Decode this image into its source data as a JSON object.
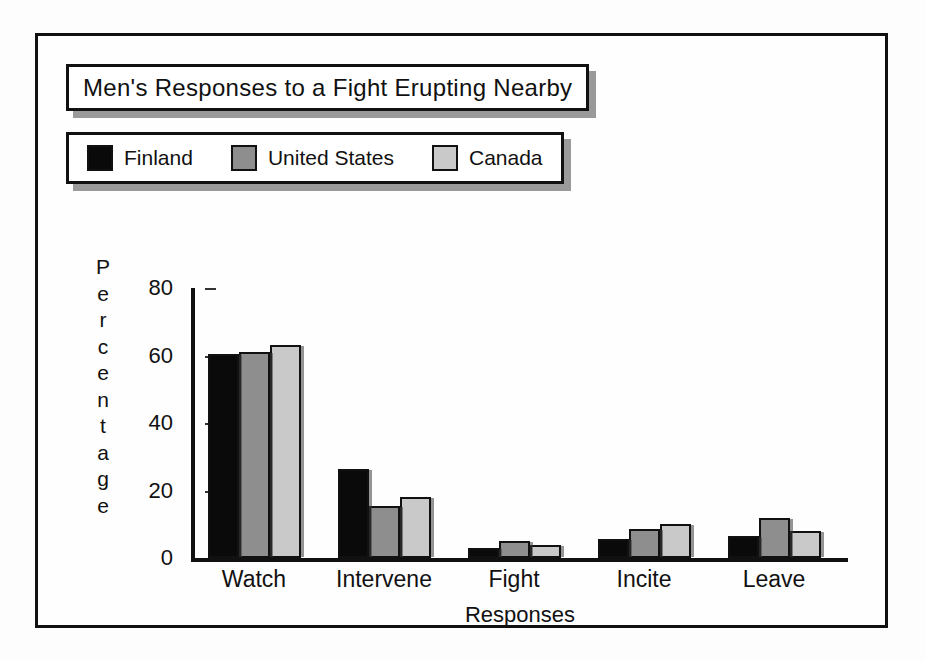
{
  "figure": {
    "title": "Men's Responses to a Fight Erupting Nearby",
    "xlabel": "Responses",
    "ylabel": "Percentage",
    "ylabel_letters": [
      "P",
      "e",
      "r",
      "c",
      "e",
      "n",
      "t",
      "a",
      "g",
      "e"
    ]
  },
  "legend": {
    "entries": [
      {
        "label": "Finland",
        "color": "#0a0a0a",
        "swatch": "legend-swatch-finland"
      },
      {
        "label": "United States",
        "color": "#8e8e8e",
        "swatch": "legend-swatch-united-states"
      },
      {
        "label": "Canada",
        "color": "#c9c9c9",
        "swatch": "legend-swatch-canada"
      }
    ]
  },
  "chart_data": {
    "type": "bar",
    "title": "Men's Responses to a Fight Erupting Nearby",
    "xlabel": "Responses",
    "ylabel": "Percentage",
    "categories": [
      "Watch",
      "Intervene",
      "Fight",
      "Incite",
      "Leave"
    ],
    "series": [
      {
        "name": "Finland",
        "color": "#0a0a0a",
        "values": [
          60.5,
          26.5,
          3.0,
          5.5,
          6.5
        ]
      },
      {
        "name": "United States",
        "color": "#8e8e8e",
        "values": [
          61.0,
          15.5,
          5.0,
          8.5,
          12.0
        ]
      },
      {
        "name": "Canada",
        "color": "#c9c9c9",
        "values": [
          63.0,
          18.0,
          4.0,
          10.0,
          8.0
        ]
      }
    ],
    "ylim": [
      0,
      80
    ],
    "yticks": [
      0,
      20,
      40,
      60,
      80
    ],
    "ytick_labels": [
      "0",
      "20",
      "40",
      "60",
      "80"
    ],
    "grid": false,
    "legend_position": "top"
  }
}
